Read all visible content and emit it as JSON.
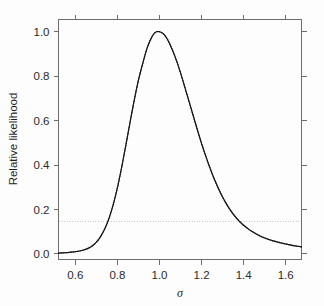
{
  "chart_data": {
    "type": "line",
    "title": "",
    "subtitle": "",
    "xlabel": "σ",
    "ylabel": "Relative likelihood",
    "xlim": [
      0.52,
      1.675
    ],
    "ylim": [
      -0.025,
      1.055
    ],
    "xticks": [
      0.6,
      0.8,
      1.0,
      1.2,
      1.4,
      1.6
    ],
    "xtick_labels": [
      "0.6",
      "0.8",
      "1.0",
      "1.2",
      "1.4",
      "1.6"
    ],
    "yticks": [
      0.0,
      0.2,
      0.4,
      0.6,
      0.8,
      1.0
    ],
    "ytick_labels": [
      "0.0",
      "0.2",
      "0.4",
      "0.6",
      "0.8",
      "1.0"
    ],
    "grid": false,
    "legend": null,
    "frame": "box",
    "tick_direction": "out",
    "series": [
      {
        "name": "Relative likelihood",
        "style": "solid-dotted",
        "color": "#222222",
        "x": [
          0.52,
          0.54,
          0.56,
          0.58,
          0.6,
          0.62,
          0.64,
          0.66,
          0.68,
          0.7,
          0.72,
          0.74,
          0.76,
          0.78,
          0.8,
          0.82,
          0.84,
          0.86,
          0.88,
          0.9,
          0.92,
          0.94,
          0.96,
          0.98,
          1.0,
          1.02,
          1.04,
          1.06,
          1.08,
          1.1,
          1.12,
          1.14,
          1.16,
          1.18,
          1.2,
          1.22,
          1.24,
          1.26,
          1.28,
          1.3,
          1.32,
          1.34,
          1.36,
          1.38,
          1.4,
          1.42,
          1.44,
          1.46,
          1.48,
          1.5,
          1.52,
          1.54,
          1.56,
          1.58,
          1.6,
          1.62,
          1.64,
          1.66,
          1.675
        ],
        "y": [
          0.004,
          0.005,
          0.006,
          0.008,
          0.01,
          0.013,
          0.018,
          0.025,
          0.036,
          0.053,
          0.078,
          0.113,
          0.16,
          0.222,
          0.298,
          0.389,
          0.489,
          0.592,
          0.692,
          0.782,
          0.856,
          0.923,
          0.97,
          0.997,
          1.0,
          0.989,
          0.962,
          0.921,
          0.872,
          0.815,
          0.752,
          0.688,
          0.623,
          0.559,
          0.497,
          0.44,
          0.387,
          0.338,
          0.295,
          0.256,
          0.222,
          0.193,
          0.168,
          0.147,
          0.129,
          0.114,
          0.101,
          0.09,
          0.08,
          0.072,
          0.065,
          0.059,
          0.054,
          0.049,
          0.045,
          0.041,
          0.037,
          0.034,
          0.032
        ]
      }
    ],
    "annotations": [
      {
        "name": "likelihood-threshold",
        "type": "hline",
        "y": 0.147,
        "style": "dotted",
        "color": "#c9c9c9",
        "label": ""
      }
    ],
    "peak": {
      "x": 1.0,
      "y": 1.0
    }
  },
  "figure": {
    "background_color": "#fdfdfd",
    "axis_color": "#6d6d6d",
    "curve_color": "#222222",
    "threshold_color": "#c9c9c9"
  }
}
